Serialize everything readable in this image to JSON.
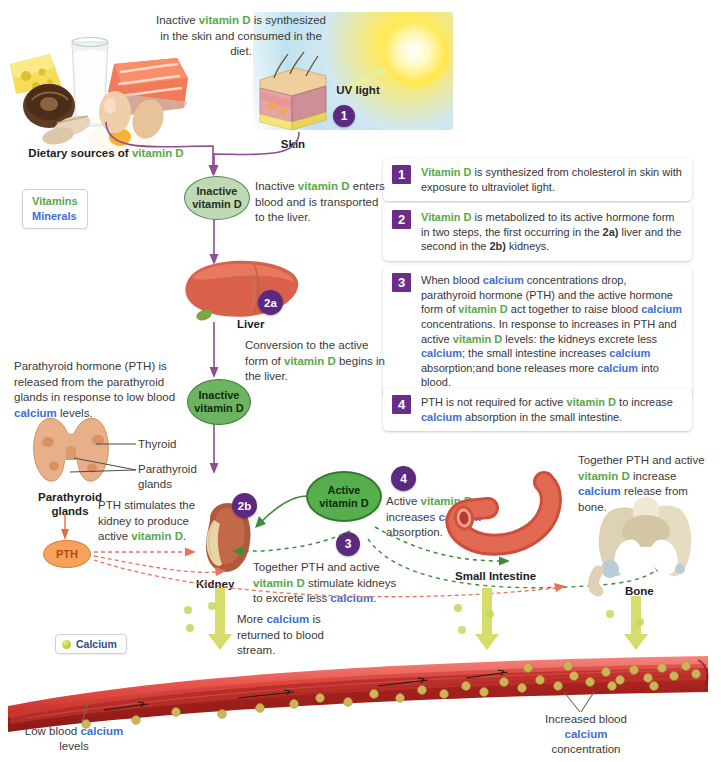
{
  "title_colors": {
    "vitamin_d": "#5aa74a",
    "calcium": "#3d6fd4",
    "badge_purple": "#6b2d87",
    "pth_orange": "#f5a35c",
    "calcium_dot": "#b9c93c"
  },
  "top": {
    "intro_note": "Inactive vitamin D is synthesized in the skin and consumed in the diet.",
    "dietary_caption_pre": "Dietary sources of ",
    "dietary_caption_vd": "vitamin D",
    "uv_label": "UV light",
    "skin_caption": "Skin",
    "skin_step": "1"
  },
  "key_box": {
    "vitamins": "Vitamins",
    "minerals": "Minerals"
  },
  "legend": {
    "items": [
      {
        "number": "1",
        "text": "Vitamin D is synthesized from cholesterol in skin with exposure to ultraviolet light."
      },
      {
        "number": "2",
        "text": "Vitamin D is metabolized to its active hormone form in two steps, the first occurring in the 2a) liver and the second in the 2b) kidneys."
      },
      {
        "number": "3",
        "text": "When blood calcium concentrations drop, parathyroid hormone (PTH) and the active hormone form of vitamin D act together to raise blood calcium concentrations. In response to increases in PTH and active vitamin D levels: the kidneys excrete less calcium; the small intestine increases calcium absorption;and bone releases more calcium into blood."
      },
      {
        "number": "4",
        "text": "PTH is not required for active vitamin D to increase calcium absorption in the small intestine."
      }
    ]
  },
  "nodes": {
    "inactive_vd_1": "Inactive vitamin D",
    "inactive_vd_2": "Inactive vitamin D",
    "active_vd": "Active vitamin D",
    "pth": "PTH"
  },
  "organs": {
    "liver": "Liver",
    "kidney": "Kidney",
    "small_intestine": "Small Intestine",
    "bone": "Bone",
    "thyroid": "Thyroid",
    "parathyroid_glands_label": "Parathyroid glands",
    "parathyroid_glands_caption": "Parathyroid glands"
  },
  "steps": {
    "skin": "1",
    "liver": "2a",
    "kidney": "2b",
    "three": "3",
    "four": "4"
  },
  "notes": {
    "blood_to_liver": "Inactive vitamin D enters blood and is transported to the liver.",
    "liver_conversion": "Conversion to the active form of vitamin D begins in the liver.",
    "parathyroid": "Parathyroid hormone (PTH) is released from the parathyroid glands in response to low blood calcium levels.",
    "pth_kidney": "PTH stimulates the kidney to produce active vitamin D.",
    "together_excrete": "Together PTH and active vitamin D stimulate kidneys to excrete less calcium.",
    "active_absorption": "Active vitamin D increases calcium absorption.",
    "bone_release": "Together PTH and active vitamin D increase calcium release from bone.",
    "more_calcium": "More calcium is returned to blood stream.",
    "low_blood": "Low blood calcium levels",
    "increased_blood": "Increased blood calcium concentration"
  },
  "calcium_legend": "Calcium"
}
